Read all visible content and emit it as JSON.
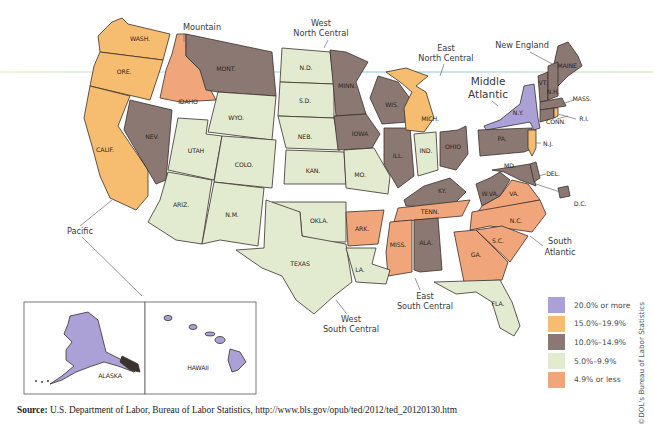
{
  "figure": {
    "title": "",
    "colors": {
      "c20_plus": "#aca1d6",
      "c15_19": "#f6bd70",
      "c10_14": "#8b7872",
      "c5_9": "#e2ebcf",
      "c0_4": "#f0a67a"
    }
  },
  "legend": {
    "items": [
      {
        "label": "20.0% or more",
        "color": "#aca1d6"
      },
      {
        "label": "15.0%–19.9%",
        "color": "#f6bd70"
      },
      {
        "label": "10.0%–14.9%",
        "color": "#8b7872"
      },
      {
        "label": "5.0%–9.9%",
        "color": "#e2ebcf"
      },
      {
        "label": "4.9% or less",
        "color": "#f0a67a"
      }
    ]
  },
  "regions": {
    "mountain": "Mountain",
    "west_north_central_1": "West",
    "west_north_central_2": "North Central",
    "east_north_central_1": "East",
    "east_north_central_2": "North Central",
    "new_england": "New England",
    "middle_atlantic_1": "Middle",
    "middle_atlantic_2": "Atlantic",
    "south_atlantic_1": "South",
    "south_atlantic_2": "Atlantic",
    "east_south_central_1": "East",
    "east_south_central_2": "South Central",
    "west_south_central_1": "West",
    "west_south_central_2": "South Central",
    "pacific": "Pacific"
  },
  "states": {
    "wash": {
      "label": "WASH.",
      "category": "15.0%–19.9%"
    },
    "ore": {
      "label": "ORE.",
      "category": "15.0%–19.9%"
    },
    "calif": {
      "label": "CALIF.",
      "category": "15.0%–19.9%"
    },
    "idaho": {
      "label": "IDAHO",
      "category": "4.9% or less"
    },
    "nev": {
      "label": "NEV.",
      "category": "10.0%–14.9%"
    },
    "mont": {
      "label": "MONT.",
      "category": "10.0%–14.9%"
    },
    "wyo": {
      "label": "WYO.",
      "category": "5.0%–9.9%"
    },
    "utah": {
      "label": "UTAH",
      "category": "5.0%–9.9%"
    },
    "colo": {
      "label": "COLO.",
      "category": "5.0%–9.9%"
    },
    "ariz": {
      "label": "ARIZ.",
      "category": "5.0%–9.9%"
    },
    "nm": {
      "label": "N.M.",
      "category": "5.0%–9.9%"
    },
    "nd": {
      "label": "N.D.",
      "category": "5.0%–9.9%"
    },
    "sd": {
      "label": "S.D.",
      "category": "5.0%–9.9%"
    },
    "neb": {
      "label": "NEB.",
      "category": "5.0%–9.9%"
    },
    "kan": {
      "label": "KAN.",
      "category": "5.0%–9.9%"
    },
    "minn": {
      "label": "MINN.",
      "category": "10.0%–14.9%"
    },
    "iowa": {
      "label": "IOWA",
      "category": "10.0%–14.9%"
    },
    "mo": {
      "label": "MO.",
      "category": "5.0%–9.9%"
    },
    "okla": {
      "label": "OKLA.",
      "category": "5.0%–9.9%"
    },
    "texas": {
      "label": "TEXAS",
      "category": "5.0%–9.9%"
    },
    "ark": {
      "label": "ARK.",
      "category": "4.9% or less"
    },
    "la": {
      "label": "LA.",
      "category": "5.0%–9.9%"
    },
    "wis": {
      "label": "WIS.",
      "category": "10.0%–14.9%"
    },
    "ill": {
      "label": "ILL.",
      "category": "10.0%–14.9%"
    },
    "mich": {
      "label": "MICH.",
      "category": "15.0%–19.9%"
    },
    "ind": {
      "label": "IND.",
      "category": "5.0%–9.9%"
    },
    "ohio": {
      "label": "OHIO",
      "category": "10.0%–14.9%"
    },
    "ky": {
      "label": "KY.",
      "category": "10.0%–14.9%"
    },
    "tenn": {
      "label": "TENN.",
      "category": "4.9% or less"
    },
    "miss": {
      "label": "MISS.",
      "category": "4.9% or less"
    },
    "ala": {
      "label": "ALA.",
      "category": "10.0%–14.9%"
    },
    "ny": {
      "label": "N.Y.",
      "category": "20.0% or more"
    },
    "pa": {
      "label": "PA.",
      "category": "10.0%–14.9%"
    },
    "nj": {
      "label": "N.J.",
      "category": "15.0%–19.9%"
    },
    "maine": {
      "label": "MAINE",
      "category": "10.0%–14.9%"
    },
    "vt": {
      "label": "VT.",
      "category": "10.0%–14.9%"
    },
    "nh": {
      "label": "N.H.",
      "category": "10.0%–14.9%"
    },
    "mass": {
      "label": "MASS.",
      "category": "10.0%–14.9%"
    },
    "conn": {
      "label": "CONN.",
      "category": "10.0%–14.9%"
    },
    "ri": {
      "label": "R.I.",
      "category": "15.0%–19.9%"
    },
    "md": {
      "label": "MD.",
      "category": "10.0%–14.9%"
    },
    "del": {
      "label": "DEL.",
      "category": "10.0%–14.9%"
    },
    "dc": {
      "label": "D.C.",
      "category": "10.0%–14.9%"
    },
    "wva": {
      "label": "W.VA.",
      "category": "10.0%–14.9%"
    },
    "va": {
      "label": "VA.",
      "category": "4.9% or less"
    },
    "nc": {
      "label": "N.C.",
      "category": "4.9% or less"
    },
    "sc": {
      "label": "S.C.",
      "category": "4.9% or less"
    },
    "ga": {
      "label": "GA.",
      "category": "4.9% or less"
    },
    "fla": {
      "label": "FLA.",
      "category": "5.0%–9.9%"
    },
    "alaska": {
      "label": "ALASKA",
      "category": "20.0% or more"
    },
    "hawaii": {
      "label": "HAWAII",
      "category": "20.0% or more"
    }
  },
  "source": {
    "prefix": "Source:",
    "text": " U.S. Department of Labor, Bureau of Labor Statistics, http://www.bls.gov/opub/ted/2012/ted_20120130.htm"
  },
  "credit": "©DOL's Bureau of Labor Statistics"
}
